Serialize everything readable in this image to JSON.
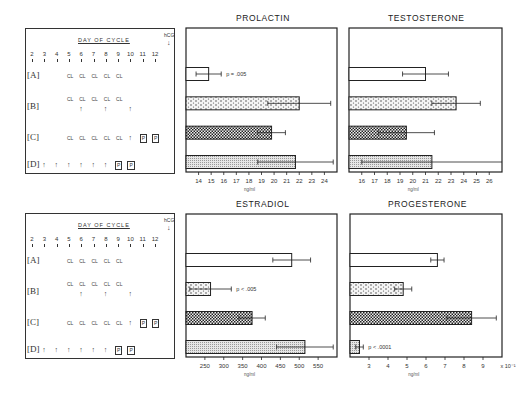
{
  "schedule": {
    "title": "DAY OF CYCLE",
    "hcg_label": "hCG",
    "days": [
      "2",
      "3",
      "4",
      "5",
      "6",
      "7",
      "8",
      "9",
      "10",
      "11",
      "12"
    ],
    "groups": [
      {
        "label": "A",
        "cl_days": [
          5,
          6,
          7,
          8,
          9
        ],
        "arrow_days": [],
        "boxed": []
      },
      {
        "label": "B",
        "cl_days": [
          5,
          6,
          7,
          8,
          9
        ],
        "arrow_days": [
          6,
          8,
          10
        ],
        "boxed": []
      },
      {
        "label": "C",
        "cl_days": [
          5,
          6,
          7,
          8,
          9
        ],
        "arrow_days": [
          10
        ],
        "boxed": [
          11,
          12
        ]
      },
      {
        "label": "D",
        "cl_days": [],
        "arrow_days": [
          3,
          4,
          5,
          6,
          7,
          8
        ],
        "boxed": [
          9,
          10
        ]
      }
    ],
    "cl_text": "CL",
    "arrow_glyph": "↑",
    "boxed_text": "P"
  },
  "chart_data": [
    {
      "type": "bar",
      "orientation": "horizontal",
      "title": "PROLACTIN",
      "xlabel": "ng/ml",
      "xlim": [
        13,
        25
      ],
      "xticks": [
        14,
        15,
        16,
        17,
        18,
        19,
        20,
        21,
        22,
        23,
        24
      ],
      "categories": [
        "A",
        "B",
        "C",
        "D"
      ],
      "values": [
        14.8,
        22.0,
        19.8,
        21.7
      ],
      "errors": [
        1.0,
        2.5,
        1.1,
        3.0
      ],
      "patterns": [
        "open",
        "dots",
        "checker",
        "fine"
      ],
      "annotations": [
        {
          "category": "A",
          "text": "p = .005"
        }
      ]
    },
    {
      "type": "bar",
      "orientation": "horizontal",
      "title": "TESTOSTERONE",
      "xlabel": "ng/ml",
      "xlim": [
        15,
        27
      ],
      "xticks": [
        16,
        17,
        18,
        19,
        20,
        21,
        22,
        23,
        24,
        25,
        26
      ],
      "categories": [
        "A",
        "B",
        "C",
        "D"
      ],
      "values": [
        21.0,
        23.4,
        19.5,
        21.5
      ],
      "errors": [
        1.8,
        1.9,
        2.2,
        5.5
      ],
      "patterns": [
        "open",
        "dots",
        "checker",
        "fine"
      ],
      "annotations": []
    },
    {
      "type": "bar",
      "orientation": "horizontal",
      "title": "ESTRADIOL",
      "xlabel": "ng/ml",
      "xlim": [
        200,
        600
      ],
      "xticks": [
        250,
        300,
        350,
        400,
        450,
        500,
        550
      ],
      "categories": [
        "A",
        "B",
        "C",
        "D"
      ],
      "values": [
        480,
        265,
        375,
        515
      ],
      "errors": [
        50,
        55,
        35,
        75
      ],
      "patterns": [
        "open",
        "dots",
        "checker",
        "fine"
      ],
      "annotations": [
        {
          "category": "B",
          "text": "p < .005"
        }
      ]
    },
    {
      "type": "bar",
      "orientation": "horizontal",
      "title": "PROGESTERONE",
      "xlabel": "ng/ml",
      "xlim": [
        2,
        10
      ],
      "xticks": [
        3,
        4,
        5,
        6,
        7,
        8,
        9
      ],
      "scale_label": "x 10⁻¹",
      "categories": [
        "A",
        "B",
        "C",
        "D"
      ],
      "values": [
        6.6,
        4.8,
        8.4,
        2.5
      ],
      "errors": [
        0.35,
        0.45,
        1.3,
        0.2
      ],
      "patterns": [
        "open",
        "dots",
        "checker",
        "fine"
      ],
      "annotations": [
        {
          "category": "D",
          "text": "p < .0001"
        }
      ]
    }
  ]
}
